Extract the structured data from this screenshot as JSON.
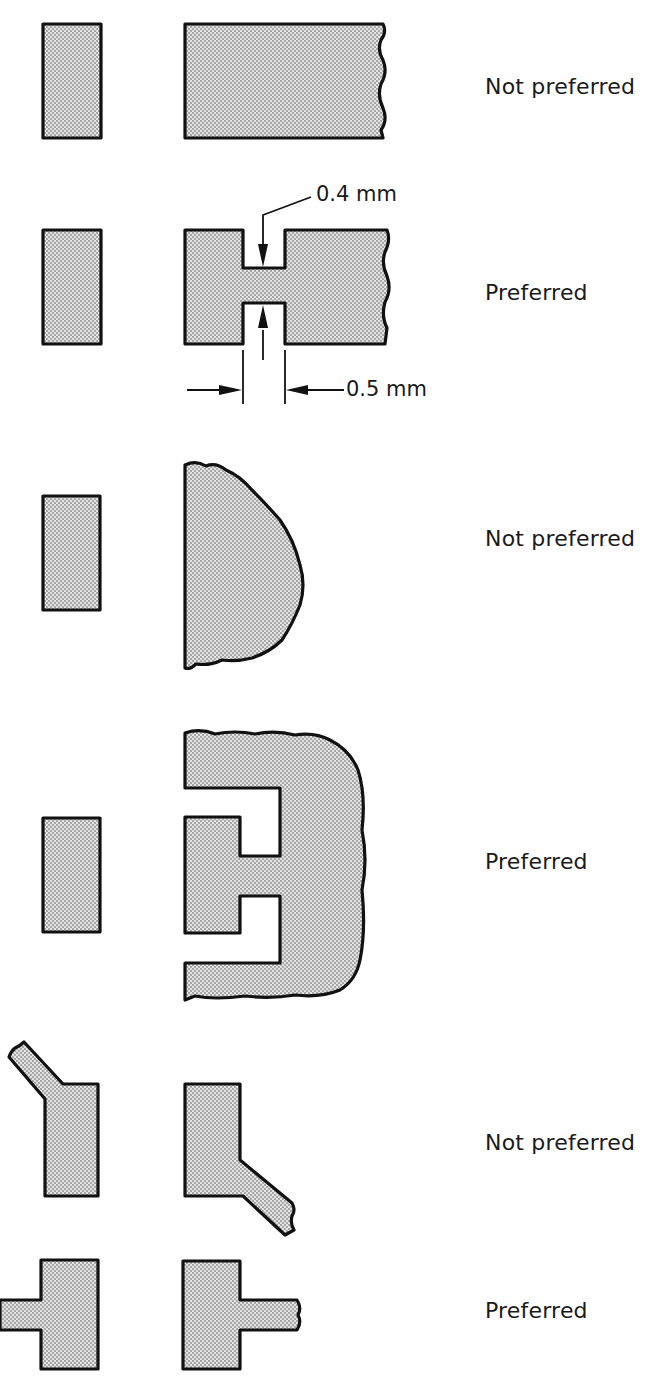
{
  "figure": {
    "rows": [
      {
        "id": "row-1",
        "label": "Not preferred",
        "verdict": "not-preferred",
        "shape": "pad-adjacent-to-large-copper-area"
      },
      {
        "id": "row-2",
        "label": "Preferred",
        "verdict": "preferred",
        "shape": "pad-with-neck-relief",
        "dimensions": [
          {
            "label": "0.4 mm",
            "measures": "neck-width"
          },
          {
            "label": "0.5 mm",
            "measures": "neck-length"
          }
        ]
      },
      {
        "id": "row-3",
        "label": "Not preferred",
        "verdict": "not-preferred",
        "shape": "pad-attached-to-irregular-copper-pour"
      },
      {
        "id": "row-4",
        "label": "Preferred",
        "verdict": "preferred",
        "shape": "pad-isolated-by-slots-in-copper-pour"
      },
      {
        "id": "row-5",
        "label": "Not preferred",
        "verdict": "not-preferred",
        "shape": "angled-trace-leaving-pad-corner"
      },
      {
        "id": "row-6",
        "label": "Preferred",
        "verdict": "preferred",
        "shape": "straight-trace-from-pad-center"
      }
    ]
  },
  "style": {
    "pad_fill": "#d8d8d8",
    "dot_color": "#8a8a8a",
    "outline_color": "#111111",
    "text_color": "#1a1a1a",
    "background": "#ffffff"
  }
}
